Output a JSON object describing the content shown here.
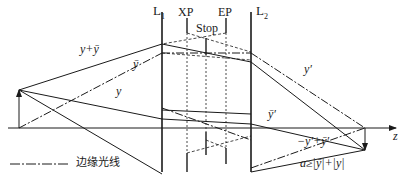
{
  "diagram": {
    "type": "optical-system-ray-diagram",
    "elements": {
      "lens1": {
        "label": "L",
        "sub": "1"
      },
      "lens2": {
        "label": "L",
        "sub": "2"
      },
      "exit_pupil": {
        "label": "XP"
      },
      "entrance_pupil": {
        "label": "EP"
      },
      "stop": {
        "label": "Stop"
      },
      "axis": {
        "label": "z"
      }
    },
    "ray_labels": {
      "y_plus_ybar": "y+ȳ",
      "ybar": "ȳ",
      "y": "y",
      "y_prime": "y′",
      "ybar_prime": "ȳ′",
      "neg_yprime_plus_ybarprime": "−y′+ȳ′"
    },
    "legend": {
      "line_style": "dash-dot",
      "label": "边缘光线"
    },
    "formula": "a≥|ȳ|+|y|",
    "colors": {
      "line": "#1a1a1a",
      "background": "#ffffff"
    }
  }
}
